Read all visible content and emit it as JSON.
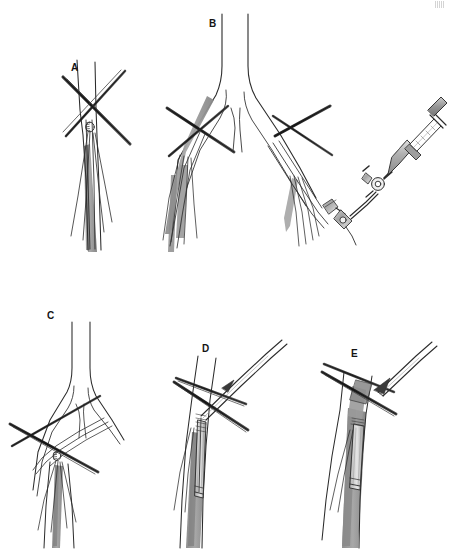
{
  "figure": {
    "caption_hidden": "",
    "background_color": "#ffffff",
    "width": 455,
    "height": 549,
    "line_color": "#2b2b2b",
    "vessel_fill": "#ffffff",
    "shadow_gray": "#9a9a9a",
    "shadow_gray_dark": "#7d7d7d",
    "metal_gray": "#b9b9b9",
    "metal_gray_dark": "#858585"
  },
  "panels": [
    {
      "id": "a",
      "label": "A",
      "label_x": 71,
      "label_y": 63,
      "title": "Purse-string suture placed on artery with crossed clamps"
    },
    {
      "id": "b",
      "label": "B",
      "label_x": 209,
      "label_y": 19,
      "title": "Aortic bifurcation with bilateral guidewires, sheath and syringe on stopcock"
    },
    {
      "id": "c",
      "label": "C",
      "label_x": 47,
      "label_y": 311,
      "title": "Bifurcation with wire access through clamped vessel"
    },
    {
      "id": "d",
      "label": "D",
      "label_x": 202,
      "label_y": 344,
      "title": "Sheath and dilator advanced over wire"
    },
    {
      "id": "e",
      "label": "E",
      "label_x": 351,
      "label_y": 349,
      "title": "Dilator withdrawn leaving sheath in place"
    }
  ],
  "elements": {
    "vessel": "vessel-outline",
    "shadow": "vessel-shading",
    "clamp": "crossed-clamp-instrument",
    "suture": "suture-thread",
    "purse_string": "purse-string-stitch",
    "guidewire": "guidewire",
    "sheath": "introducer-sheath",
    "dilator": "dilator",
    "syringe": "syringe",
    "stopcock": "three-way-stopcock",
    "arrow": "withdrawal-arrow"
  },
  "corner": {
    "artifact": "scan-artifact"
  }
}
